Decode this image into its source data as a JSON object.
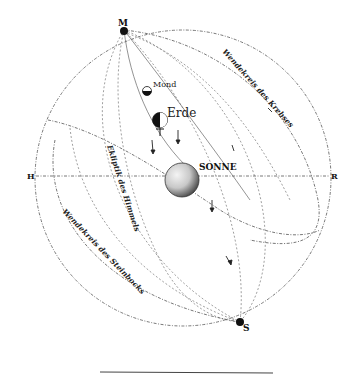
{
  "diagram": {
    "type": "celestial-sphere",
    "poles": {
      "top": "M",
      "bottom": "S"
    },
    "horizon_points": {
      "left": "H",
      "right": "R"
    },
    "bodies": {
      "sun": "SONNE",
      "earth": "Erde",
      "moon": "Mond"
    },
    "circles": {
      "tropic_cancer": "Wendekreis des Krebses",
      "ecliptic": "Ekliptik des Himmels",
      "tropic_capricorn": "Wendekreis des Steinbocks"
    },
    "footer_rule": true
  }
}
